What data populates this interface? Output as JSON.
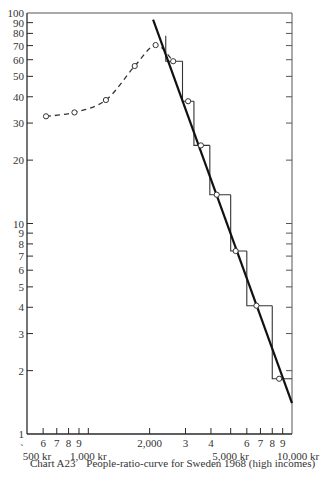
{
  "caption": {
    "id": "Chart A23",
    "title": "People-ratio-curve for Sweden 1968 (high incomes)"
  },
  "chart_data": {
    "type": "line",
    "title": "People-ratio-curve for Sweden 1968 (high incomes)",
    "xscale": "log",
    "yscale": "log",
    "xlim": [
      500,
      10000
    ],
    "ylim": [
      1,
      100
    ],
    "grid": false,
    "x_ticks": [
      {
        "value": 500,
        "label": "500 kr",
        "row": 2
      },
      {
        "value": 600,
        "label": "6",
        "row": 1
      },
      {
        "value": 700,
        "label": "7",
        "row": 1
      },
      {
        "value": 800,
        "label": "8",
        "row": 1
      },
      {
        "value": 900,
        "label": "9",
        "row": 1
      },
      {
        "value": 1000,
        "label": "1,000 kr",
        "row": 2
      },
      {
        "value": 2000,
        "label": "2,000",
        "row": 1
      },
      {
        "value": 3000,
        "label": "3",
        "row": 1
      },
      {
        "value": 4000,
        "label": "4",
        "row": 1
      },
      {
        "value": 5000,
        "label": "5,000 kr",
        "row": 2
      },
      {
        "value": 6000,
        "label": "6",
        "row": 1
      },
      {
        "value": 7000,
        "label": "7",
        "row": 1
      },
      {
        "value": 8000,
        "label": "8",
        "row": 1
      },
      {
        "value": 9000,
        "label": "9",
        "row": 1
      },
      {
        "value": 10000,
        "label": "10,000 kr",
        "row": 2
      }
    ],
    "y_ticks": [
      {
        "value": 1,
        "label": "1"
      },
      {
        "value": 2,
        "label": "2"
      },
      {
        "value": 3,
        "label": "3"
      },
      {
        "value": 4,
        "label": "4"
      },
      {
        "value": 5,
        "label": "5"
      },
      {
        "value": 6,
        "label": "6"
      },
      {
        "value": 7,
        "label": "7"
      },
      {
        "value": 8,
        "label": "8"
      },
      {
        "value": 9,
        "label": "9"
      },
      {
        "value": 10,
        "label": "10"
      },
      {
        "value": 20,
        "label": "20"
      },
      {
        "value": 30,
        "label": "30"
      },
      {
        "value": 40,
        "label": "40"
      },
      {
        "value": 50,
        "label": "50"
      },
      {
        "value": 60,
        "label": "60"
      },
      {
        "value": 70,
        "label": "70"
      },
      {
        "value": 80,
        "label": "80"
      },
      {
        "value": 90,
        "label": "90"
      },
      {
        "value": 100,
        "label": "100"
      }
    ],
    "series": [
      {
        "name": "Observed people-ratio (dashed)",
        "style": "dashed-with-circles",
        "points": [
          [
            620,
            32.3
          ],
          [
            855,
            33.7
          ],
          [
            1220,
            38.6
          ],
          [
            1690,
            56
          ],
          [
            2140,
            70.4
          ],
          [
            2610,
            59
          ]
        ]
      },
      {
        "name": "Step histogram (people-ratio by income band)",
        "style": "step",
        "steps": [
          {
            "x0": 2400,
            "x1": 2900,
            "y": 59,
            "y_prev": 78
          },
          {
            "x0": 2900,
            "x1": 3300,
            "y": 38.1
          },
          {
            "x0": 3300,
            "x1": 3950,
            "y": 23.5
          },
          {
            "x0": 3950,
            "x1": 5000,
            "y": 13.7
          },
          {
            "x0": 5000,
            "x1": 6000,
            "y": 7.4
          },
          {
            "x0": 6000,
            "x1": 8000,
            "y": 4.07
          },
          {
            "x0": 8000,
            "x1": 10000,
            "y": 1.83
          }
        ]
      },
      {
        "name": "Step midpoints",
        "style": "circles",
        "points": [
          [
            2610,
            59
          ],
          [
            3090,
            38.1
          ],
          [
            3570,
            23.5
          ],
          [
            4270,
            13.7
          ],
          [
            5290,
            7.4
          ],
          [
            6690,
            4.07
          ],
          [
            8650,
            1.83
          ]
        ]
      },
      {
        "name": "Fitted straight line (Pareto)",
        "style": "solid-bold",
        "points": [
          [
            2080,
            93
          ],
          [
            10000,
            1.4
          ]
        ]
      }
    ]
  }
}
